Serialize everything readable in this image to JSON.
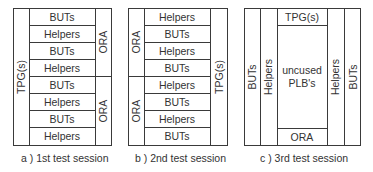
{
  "panels": [
    {
      "id": "a",
      "caption": "a ) 1st test session",
      "left_label": "TPG(s)",
      "rows": [
        "BUTs",
        "Helpers",
        "BUTs",
        "Helpers",
        "BUTs",
        "Helpers",
        "BUTs",
        "Helpers"
      ],
      "right_labels": [
        "ORA",
        "ORA"
      ]
    },
    {
      "id": "b",
      "caption": "b ) 2nd test session",
      "left_labels": [
        "ORA",
        "ORA"
      ],
      "rows": [
        "Helpers",
        "BUTs",
        "Helpers",
        "BUTs",
        "Helpers",
        "BUTs",
        "Helpers",
        "BUTs"
      ],
      "right_label": "TPG(s)"
    },
    {
      "id": "c",
      "caption": "c ) 3rd test session",
      "columns_left": [
        "BUTs",
        "Helpers"
      ],
      "top": "TPG(s)",
      "center_line1": "uncused",
      "center_line2": "PLB's",
      "bottom": "ORA",
      "columns_right": [
        "Helpers",
        "BUTs"
      ]
    }
  ]
}
